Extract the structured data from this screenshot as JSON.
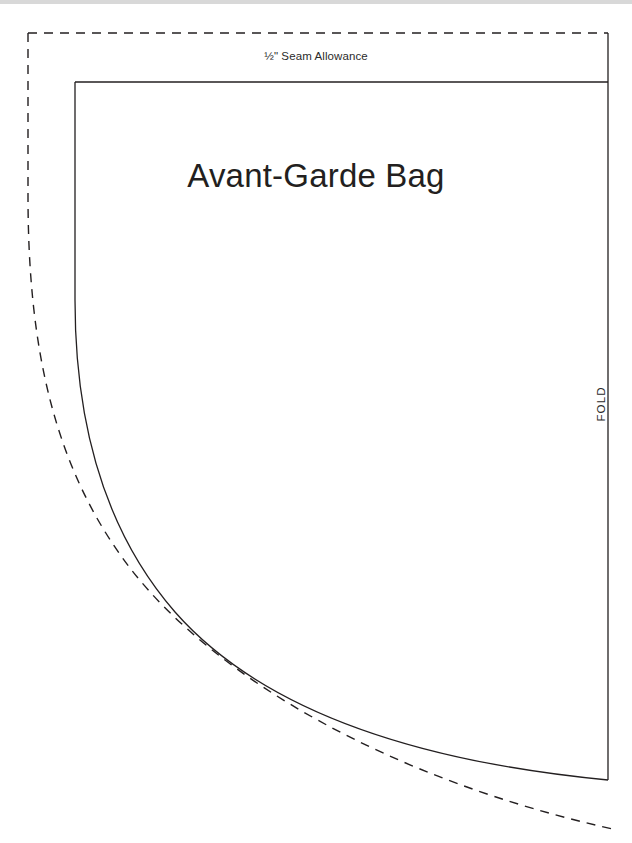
{
  "page": {
    "width": 632,
    "height": 843,
    "background_color": "#ffffff",
    "top_edge_band_color": "#d8d8d8"
  },
  "labels": {
    "seam_allowance": "½\" Seam Allowance",
    "title": "Avant-Garde Bag",
    "fold": "FOLD"
  },
  "colors": {
    "line": "#231f20",
    "text": "#231f20",
    "small_text": "#2b2b2b"
  },
  "geometry": {
    "stroke_width_solid": 1.3,
    "stroke_width_dashed": 1.4,
    "dash_pattern": "9 7",
    "solid": {
      "top_horizontal": {
        "x1": 75,
        "y1": 82,
        "x2": 608,
        "y2": 82
      },
      "right_vertical": {
        "x1": 608,
        "y1": 33,
        "x2": 608,
        "y2": 780
      },
      "curve_path": "M 75,82 L 75,300 C 75,430 108,535 175,612 C 255,703 400,760 608,780"
    },
    "dashed": {
      "top_horizontal": {
        "x1": 28,
        "y1": 33,
        "x2": 608,
        "y2": 33
      },
      "curve_path": "M 28,33 L 28,196 C 28,350 55,470 130,568 C 215,678 390,780 617,830"
    }
  },
  "pattern_pieces": [
    {
      "name": "cutting-line",
      "style": "dashed",
      "meaning": "½\" seam allowance / cut line"
    },
    {
      "name": "stitching-line",
      "style": "solid",
      "meaning": "finished sewing line"
    },
    {
      "name": "fold-edge",
      "style": "solid",
      "meaning": "place on fold"
    }
  ]
}
